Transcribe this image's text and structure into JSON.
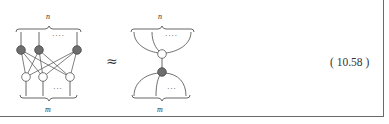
{
  "figure": {
    "left_diagram": {
      "top_label": "n",
      "bottom_label": "m",
      "top_ellipsis": "····",
      "bottom_ellipsis": "···",
      "dark_nodes": 3,
      "white_nodes": 3,
      "description": "Complete bipartite network: n dark (filled) nodes on top, m white (hollow) nodes on bottom, every dark node connected to every white node"
    },
    "relation_symbol": "≈",
    "right_diagram": {
      "top_label": "n",
      "bottom_label": "m",
      "top_ellipsis": "····",
      "bottom_ellipsis": "···",
      "description": "n top legs merge into a single white node, joined by one edge to a single dark node that fans out into m bottom legs"
    },
    "equation_number": "( 10.58 )"
  },
  "colors": {
    "line": "#555555",
    "dark_node_fill": "#6e6e6e",
    "dark_node_stroke": "#444444",
    "white_node_fill": "#ffffff",
    "white_node_stroke": "#555555",
    "frame": "#6a6a6a"
  }
}
